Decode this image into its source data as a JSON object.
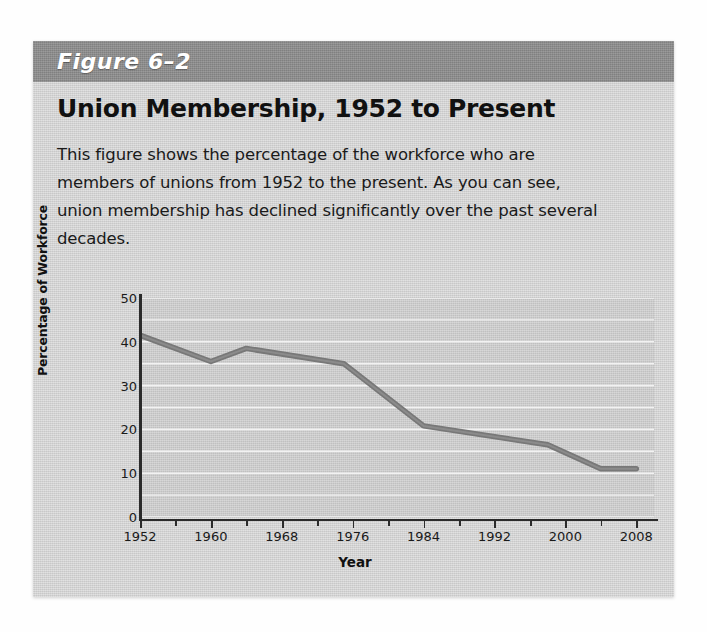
{
  "figure": {
    "label": "Figure 6–2",
    "title": "Union Membership, 1952 to Present",
    "description": "This figure shows the percentage of the workforce who are members of unions from 1952 to the present. As you can see, union membership has declined significantly over the past several decades.",
    "band_color": "#8d8d8d",
    "card_color": "#d2d2d2"
  },
  "chart_data": {
    "type": "line",
    "title": "Union Membership, 1952 to Present",
    "xlabel": "Year",
    "ylabel": "Percentage of Workforce",
    "xlim": [
      1952,
      2010
    ],
    "ylim": [
      0,
      50
    ],
    "ytick_labels": [
      "0",
      "10",
      "20",
      "30",
      "40",
      "50"
    ],
    "ytick_values": [
      0,
      10,
      20,
      30,
      40,
      50
    ],
    "xtick_labels": [
      "1952",
      "1960",
      "1968",
      "1976",
      "1984",
      "1992",
      "2000",
      "2008"
    ],
    "xtick_values": [
      1952,
      1960,
      1968,
      1976,
      1984,
      1992,
      2000,
      2008
    ],
    "xminor_values": [
      1956,
      1964,
      1972,
      1980,
      1988,
      1996,
      2004
    ],
    "grid": "horizontal",
    "legend": "none",
    "line_color": "#787878",
    "plot_background": "#c9c9c9",
    "series": [
      {
        "name": "Percentage of Workforce",
        "x": [
          1952,
          1960,
          1964,
          1975,
          1984,
          1998,
          2004,
          2008
        ],
        "values": [
          41.5,
          35.5,
          38.5,
          35.0,
          20.8,
          16.5,
          11.0,
          11.0
        ]
      }
    ]
  }
}
